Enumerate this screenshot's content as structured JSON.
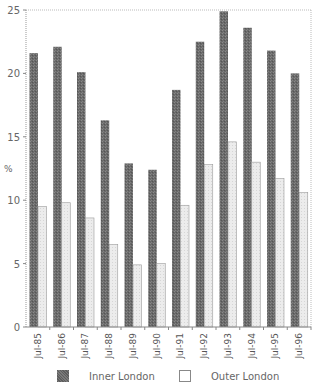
{
  "chart_data": {
    "type": "bar",
    "title": "",
    "xlabel": "",
    "ylabel": "%",
    "ylim": [
      0,
      25
    ],
    "yticks": [
      0,
      5,
      10,
      15,
      20,
      25
    ],
    "grid": false,
    "legend_position": "bottom",
    "categories": [
      "Jul-85",
      "Jul-86",
      "Jul-87",
      "Jul-88",
      "Jul-89",
      "Jul-90",
      "Jul-91",
      "Jul-92",
      "Jul-93",
      "Jul-94",
      "Jul-95",
      "Jul-96"
    ],
    "series": [
      {
        "name": "Inner London",
        "color": "#6e6e6e",
        "values": [
          21.6,
          22.1,
          20.1,
          16.3,
          12.9,
          12.4,
          18.7,
          22.5,
          24.9,
          23.6,
          21.8,
          20.0
        ]
      },
      {
        "name": "Outer London",
        "color": "#e6e6e6",
        "values": [
          9.5,
          9.8,
          8.6,
          6.5,
          4.9,
          5.0,
          9.6,
          12.8,
          14.6,
          13.0,
          11.7,
          10.6
        ]
      }
    ]
  },
  "legend": {
    "inner_label": "Inner London",
    "outer_label": "Outer London"
  },
  "axis": {
    "y_title": "%"
  }
}
